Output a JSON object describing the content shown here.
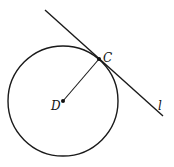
{
  "diagram": {
    "colors": {
      "stroke": "#1a1a1a",
      "background": "#ffffff"
    },
    "circle": {
      "center_label": "D",
      "cx": 63,
      "cy": 101,
      "r": 55
    },
    "points": [
      {
        "label": "C",
        "x": 99,
        "y": 59
      },
      {
        "label": "D",
        "x": 63,
        "y": 101
      }
    ],
    "segments": [
      {
        "name": "radius DC",
        "from": "D",
        "to": "C"
      }
    ],
    "lines": [
      {
        "label": "l",
        "x1": 45,
        "y1": 10,
        "x2": 163,
        "y2": 116,
        "relation": "tangent to circle at C"
      }
    ],
    "labels": {
      "point_c": "C",
      "point_d": "D",
      "line_l": "l"
    }
  }
}
